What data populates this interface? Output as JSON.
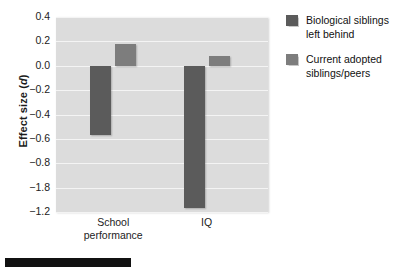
{
  "chart_data": {
    "type": "bar",
    "title": "",
    "xlabel": "",
    "ylabel": "Effect size (d)",
    "ylabel_plain": "Effect size",
    "ylabel_italic": "d",
    "categories": [
      "School performance",
      "IQ"
    ],
    "series": [
      {
        "name": "Biological siblings left behind",
        "color": "#5b5b5b",
        "values": [
          -0.57,
          -1.17
        ]
      },
      {
        "name": "Current adopted siblings/peers",
        "color": "#7d7d7d",
        "values": [
          0.18,
          0.08
        ]
      }
    ],
    "ytick_labels": [
      "0.4",
      "0.2",
      "0.0",
      "−0.2",
      "−0.4",
      "−0.6",
      "−0.8",
      "−1.8",
      "−1.2"
    ],
    "ytick_values": [
      0.4,
      0.2,
      0.0,
      -0.2,
      -0.4,
      -0.6,
      -0.8,
      -1.0,
      -1.2
    ],
    "ylim": [
      -1.2,
      0.4
    ],
    "grid": true,
    "legend_position": "right",
    "plot_background": "#dcdcdc",
    "gridline_color": "#f4f4f4"
  },
  "legend": {
    "entries": [
      {
        "line1": "Biological siblings",
        "line2": "left behind"
      },
      {
        "line1": "Current adopted",
        "line2": "siblings/peers"
      }
    ]
  },
  "x_labels": [
    {
      "line1": "School",
      "line2": "performance"
    },
    {
      "line1": "IQ",
      "line2": ""
    }
  ]
}
